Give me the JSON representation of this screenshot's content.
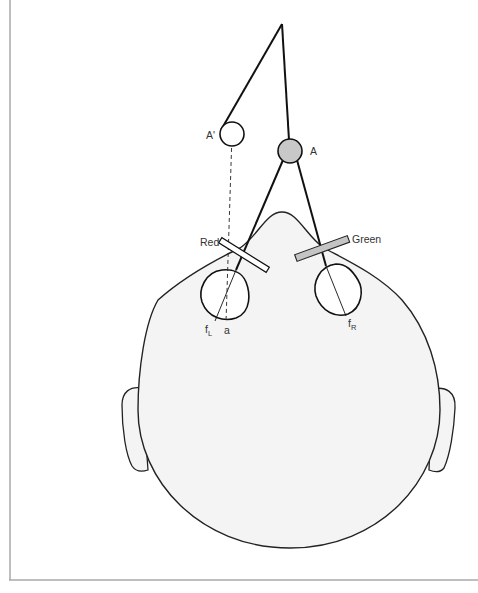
{
  "figure": {
    "labels": {
      "apparent_object": "A'",
      "object": "A",
      "red_filter": "Red",
      "green_filter": "Green",
      "fovea_left": "f",
      "fovea_left_sub": "L",
      "fovea_right": "f",
      "fovea_right_sub": "R",
      "point_a": "a"
    },
    "colors": {
      "line": "#111111",
      "head_fill": "#f4f4f4",
      "object_fill": "#c8c8c8",
      "red_filter_fill": "#ffffff",
      "green_filter_fill": "#c4c4c4",
      "frame": "#a8a8a8"
    }
  }
}
